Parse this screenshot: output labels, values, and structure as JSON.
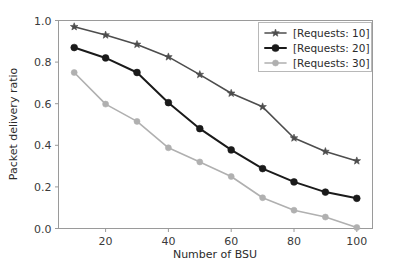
{
  "chart_data": {
    "type": "line",
    "title": "",
    "xlabel": "Number of BSU",
    "ylabel": "Packet delivery ratio",
    "x": [
      10,
      20,
      30,
      40,
      50,
      60,
      70,
      80,
      90,
      100
    ],
    "xlim": [
      5,
      105
    ],
    "ylim": [
      0.0,
      1.0
    ],
    "xticks": [
      20,
      40,
      60,
      80,
      100
    ],
    "xtick_labels": [
      "20",
      "40",
      "60",
      "80",
      "100"
    ],
    "yticks": [
      0.0,
      0.2,
      0.4,
      0.6,
      0.8,
      1.0
    ],
    "ytick_labels": [
      "0.0",
      "0.2",
      "0.4",
      "0.6",
      "0.8",
      "1.0"
    ],
    "grid": false,
    "legend_position": "upper right",
    "series": [
      {
        "name": "[Requests: 10]",
        "color": "#4d4d4d",
        "marker": "star",
        "linewidth": 1.6,
        "values": [
          0.97,
          0.93,
          0.885,
          0.825,
          0.74,
          0.65,
          0.585,
          0.435,
          0.37,
          0.325
        ]
      },
      {
        "name": "[Requests: 20]",
        "color": "#1a1a1a",
        "marker": "circle",
        "linewidth": 2.0,
        "values": [
          0.87,
          0.82,
          0.75,
          0.605,
          0.48,
          0.378,
          0.288,
          0.224,
          0.175,
          0.145
        ]
      },
      {
        "name": "[Requests: 30]",
        "color": "#b0b0b0",
        "marker": "circle",
        "linewidth": 1.6,
        "values": [
          0.75,
          0.598,
          0.515,
          0.388,
          0.32,
          0.25,
          0.148,
          0.088,
          0.055,
          0.005
        ]
      }
    ]
  },
  "axes": {
    "x_axis_label": "Number of BSU",
    "y_axis_label": "Packet delivery ratio"
  },
  "legend": {
    "entries": [
      {
        "label": "[Requests: 10]"
      },
      {
        "label": "[Requests: 20]"
      },
      {
        "label": "[Requests: 30]"
      }
    ]
  }
}
